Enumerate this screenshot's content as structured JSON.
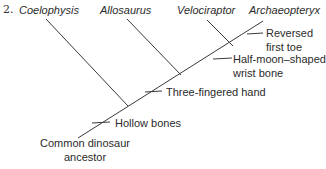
{
  "question_number": "2.",
  "taxa": [
    "Coelophysis",
    "Allosaurus",
    "Velociraptor",
    "Archaeopteryx"
  ],
  "traits": {
    "reversed_toe": [
      "Reversed",
      "first toe"
    ],
    "wrist_bone": [
      "Half-moon–shaped",
      "wrist bone"
    ],
    "three_fingered": "Three-fingered hand",
    "hollow_bones": "Hollow bones"
  },
  "root": [
    "Common dinosaur",
    "ancestor"
  ],
  "colors": {
    "line": "#3a3a3a",
    "text": "#2b2b2b"
  }
}
